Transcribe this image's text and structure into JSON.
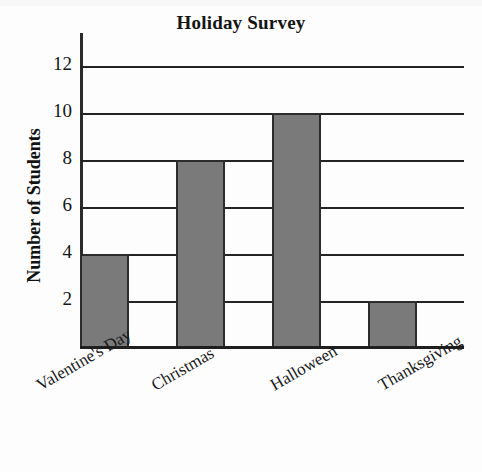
{
  "chart_data": {
    "type": "bar",
    "title": "Holiday Survey",
    "xlabel": "",
    "ylabel": "Number of Students",
    "categories": [
      "Valentine's Day",
      "Christmas",
      "Halloween",
      "Thanksgiving"
    ],
    "values": [
      4,
      8,
      10,
      2
    ],
    "ylim": [
      0,
      12
    ],
    "ytick_labels": [
      "2",
      "4",
      "6",
      "8",
      "10",
      "12"
    ],
    "ytick_values": [
      2,
      4,
      6,
      8,
      10,
      12
    ],
    "grid": true,
    "legend": false,
    "bar_color": "#7a7a7a",
    "bar_edge_color": "#2c2c2c",
    "axis_color": "#242424",
    "xlabel_rotation": -30
  }
}
